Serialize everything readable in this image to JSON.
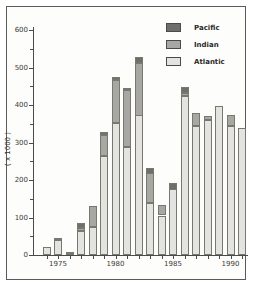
{
  "window": {
    "title": "Stacked bar chart panel"
  },
  "chart_data": {
    "type": "bar",
    "stacked": true,
    "title": "",
    "ylabel": "( x 1000 )",
    "xlabel": "",
    "ylim": [
      0,
      600
    ],
    "yticks_major": [
      0,
      100,
      200,
      300,
      400,
      500,
      600
    ],
    "ytick_minor_step": 50,
    "grid": false,
    "legend_position": "top-right",
    "legend_order": [
      "Pacific",
      "Indian",
      "Atlantic"
    ],
    "categories": [
      "1974",
      "1975",
      "1976",
      "1977",
      "1978",
      "1979",
      "1980",
      "1981",
      "1982",
      "1983",
      "1984",
      "1985",
      "1986",
      "1987",
      "1988",
      "1989",
      "1990",
      "1991"
    ],
    "xtick_labeled": [
      "1975",
      "1980",
      "1985",
      "1990"
    ],
    "series": [
      {
        "name": "Atlantic",
        "color": "#e3e3df",
        "values": [
          20,
          40,
          5,
          65,
          75,
          265,
          352,
          288,
          372,
          138,
          105,
          175,
          425,
          344,
          360,
          398,
          344,
          338
        ]
      },
      {
        "name": "Indian",
        "color": "#a7a7a3",
        "values": [
          0,
          5,
          3,
          8,
          55,
          55,
          115,
          152,
          140,
          80,
          27,
          0,
          8,
          34,
          10,
          0,
          30,
          0
        ]
      },
      {
        "name": "Pacific",
        "color": "#6e6e6a",
        "values": [
          0,
          0,
          0,
          12,
          0,
          8,
          8,
          5,
          15,
          15,
          0,
          18,
          15,
          0,
          0,
          0,
          0,
          0
        ]
      }
    ]
  },
  "colors": {
    "frame_border": "#5a5a58",
    "axis": "#4a4a48",
    "background": "#fdfdfb",
    "pacific": "#6e6e6a",
    "indian": "#a7a7a3",
    "atlantic": "#e3e3df"
  }
}
